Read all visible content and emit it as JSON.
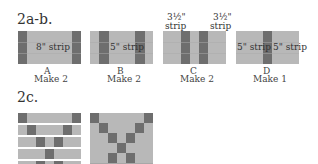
{
  "section_ab": {
    "title": "2a-b.",
    "blocks": [
      {
        "letter": "A",
        "make": "Make 2",
        "strip_label": "8\" strip"
      },
      {
        "letter": "B",
        "make": "Make 2",
        "strip_label": "5\" strip"
      },
      {
        "letter": "C",
        "make": "Make 2",
        "top_labels": [
          "3½\"",
          "strip",
          "3½\"",
          "strip"
        ]
      },
      {
        "letter": "D",
        "make": "Make 1",
        "strip_labels": [
          "5\" strip",
          "5\" strip"
        ]
      }
    ]
  },
  "section_c": {
    "title": "2c."
  },
  "colors": {
    "light": "#b8b8b8",
    "dark": "#6e6e6e"
  }
}
